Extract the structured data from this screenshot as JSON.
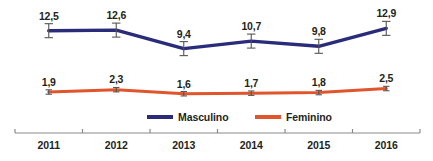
{
  "chart_data": {
    "type": "line",
    "title": "",
    "subtitle": "",
    "xlabel": "",
    "ylabel": "",
    "categories": [
      "2011",
      "2012",
      "2013",
      "2014",
      "2015",
      "2016"
    ],
    "grid": false,
    "legend_position": "bottom",
    "ylim": [
      0,
      14
    ],
    "decimal_separator": ",",
    "error_bars": true,
    "series": [
      {
        "name": "Masculino",
        "color": "#2b2b7c",
        "values": [
          12.5,
          12.6,
          9.4,
          10.7,
          9.8,
          12.9
        ],
        "labels": [
          "12,5",
          "12,6",
          "9,4",
          "10,7",
          "9,8",
          "12,9"
        ]
      },
      {
        "name": "Feminino",
        "color": "#e0552c",
        "values": [
          1.9,
          2.3,
          1.6,
          1.7,
          1.8,
          2.5
        ],
        "labels": [
          "1,9",
          "2,3",
          "1,6",
          "1,7",
          "1,8",
          "2,5"
        ]
      }
    ]
  },
  "axis": {
    "tick_labels": [
      "2011",
      "2012",
      "2013",
      "2014",
      "2015",
      "2016"
    ],
    "line_color": "#8a8a8a"
  },
  "legend": {
    "items": [
      {
        "label": "Masculino",
        "color": "#2b2b7c"
      },
      {
        "label": "Feminino",
        "color": "#e0552c"
      }
    ]
  },
  "colors": {
    "masculino": "#2b2b7c",
    "feminino": "#e0552c",
    "text": "#231f20",
    "axis": "#8a8a8a",
    "background": "#ffffff"
  }
}
